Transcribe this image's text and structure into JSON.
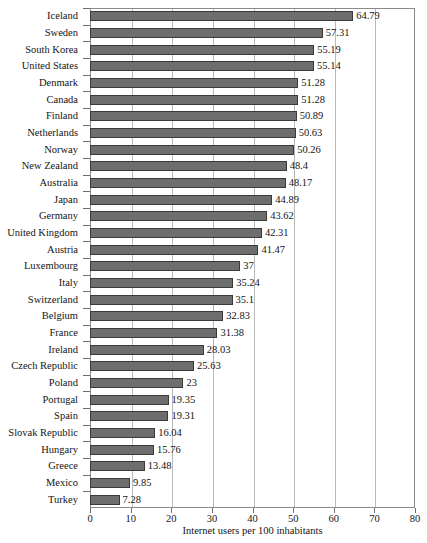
{
  "chart_data": {
    "type": "bar",
    "orientation": "horizontal",
    "title": "",
    "subtitle": "",
    "xlabel": "Internet users per 100 inhabitants",
    "ylabel": "",
    "xlim": [
      0,
      80
    ],
    "xticks": [
      0,
      10,
      20,
      30,
      40,
      50,
      60,
      70,
      80
    ],
    "xtick_labels": [
      "0",
      "10",
      "20",
      "30",
      "40",
      "50",
      "60",
      "70",
      "80"
    ],
    "grid": "vertical",
    "legend": "none",
    "bar_color": "#6e6e6e",
    "bar_edge_color": "#3a3a3a",
    "grid_color": "#b9b9b9",
    "frame_color": "#8a8a8a",
    "categories": [
      "Iceland",
      "Sweden",
      "South Korea",
      "United States",
      "Denmark",
      "Canada",
      "Finland",
      "Netherlands",
      "Norway",
      "New Zealand",
      "Australia",
      "Japan",
      "Germany",
      "United Kingdom",
      "Austria",
      "Luxembourg",
      "Italy",
      "Switzerland",
      "Belgium",
      "France",
      "Ireland",
      "Czech Republic",
      "Poland",
      "Portugal",
      "Spain",
      "Slovak Republic",
      "Hungary",
      "Greece",
      "Mexico",
      "Turkey"
    ],
    "values": [
      64.79,
      57.31,
      55.19,
      55.14,
      51.28,
      51.28,
      50.89,
      50.63,
      50.26,
      48.4,
      48.17,
      44.89,
      43.62,
      42.31,
      41.47,
      37,
      35.24,
      35.1,
      32.83,
      31.38,
      28.03,
      25.63,
      23,
      19.35,
      19.31,
      16.04,
      15.76,
      13.48,
      9.85,
      7.28
    ],
    "value_labels": [
      "64.79",
      "57.31",
      "55.19",
      "55.14",
      "51.28",
      "51.28",
      "50.89",
      "50.63",
      "50.26",
      "48.4",
      "48.17",
      "44.89",
      "43.62",
      "42.31",
      "41.47",
      "37",
      "35.24",
      "35.1",
      "32.83",
      "31.38",
      "28.03",
      "25.63",
      "23",
      "19.35",
      "19.31",
      "16.04",
      "15.76",
      "13.48",
      "9.85",
      "7.28"
    ]
  }
}
